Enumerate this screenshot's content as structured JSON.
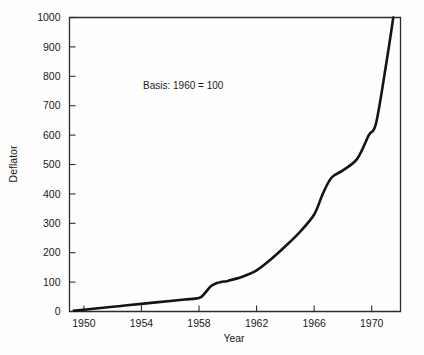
{
  "chart_data": {
    "type": "line",
    "title": "",
    "xlabel": "Year",
    "ylabel": "Deflator",
    "annotation": "Basis: 1960 = 100",
    "xlim": [
      1949,
      1972
    ],
    "ylim": [
      0,
      1000
    ],
    "grid": false,
    "legend": "none",
    "xticks": [
      1950,
      1954,
      1958,
      1962,
      1966,
      1970
    ],
    "xtick_labels": [
      "1950",
      "1954",
      "1958",
      "1962",
      "1966",
      "1970"
    ],
    "yticks": [
      0,
      100,
      200,
      300,
      400,
      500,
      600,
      700,
      800,
      900,
      1000
    ],
    "ytick_labels": [
      "0",
      "100",
      "200",
      "300",
      "400",
      "500",
      "600",
      "700",
      "800",
      "900",
      "1000"
    ],
    "series": [
      {
        "name": "Deflator",
        "color": "#141414",
        "x": [
          1949.3,
          1950,
          1951,
          1952,
          1953,
          1954,
          1955,
          1956,
          1957,
          1958,
          1958.4,
          1958.8,
          1959.2,
          1959.6,
          1960,
          1961,
          1962,
          1963,
          1964,
          1965,
          1966,
          1966.6,
          1967.2,
          1968,
          1969,
          1969.8,
          1970.3,
          1971,
          1971.5
        ],
        "y": [
          3,
          6,
          11,
          16,
          21,
          26,
          31,
          36,
          41,
          46,
          62,
          85,
          96,
          101,
          104,
          118,
          140,
          178,
          222,
          270,
          330,
          400,
          455,
          480,
          520,
          600,
          640,
          840,
          1000
        ]
      }
    ]
  },
  "axes": {
    "ylabel": "Deflator",
    "xlabel": "Year"
  },
  "annotation": {
    "text": "Basis: 1960 = 100"
  }
}
